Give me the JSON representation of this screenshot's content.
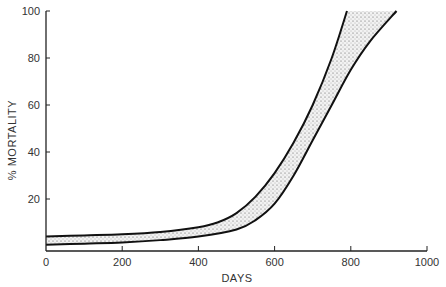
{
  "chart_data": {
    "type": "area",
    "title": "",
    "xlabel": "DAYS",
    "ylabel": "% MORTALITY",
    "xlim": [
      0,
      1000
    ],
    "ylim": [
      0,
      100
    ],
    "x_ticks": [
      0,
      200,
      400,
      600,
      800,
      1000
    ],
    "y_ticks": [
      20,
      40,
      60,
      80,
      100
    ],
    "x_tick_labels": [
      "0",
      "200",
      "400",
      "600",
      "800",
      "1000"
    ],
    "y_tick_labels": [
      "20",
      "40",
      "60",
      "80",
      "100"
    ],
    "grid": false,
    "legend": null,
    "series": [
      {
        "name": "upper bound",
        "x": [
          0,
          100,
          200,
          300,
          400,
          450,
          500,
          550,
          600,
          650,
          700,
          750,
          790
        ],
        "values": [
          4,
          4.5,
          5,
          6,
          8,
          10,
          14,
          21,
          31,
          44,
          60,
          80,
          100
        ]
      },
      {
        "name": "lower bound",
        "x": [
          0,
          100,
          200,
          300,
          400,
          500,
          550,
          600,
          650,
          700,
          750,
          800,
          850,
          920
        ],
        "values": [
          0.5,
          1,
          1.5,
          2.5,
          4,
          7,
          11,
          18,
          30,
          45,
          60,
          75,
          87,
          100
        ]
      }
    ],
    "fill": "stippled between bounds"
  }
}
